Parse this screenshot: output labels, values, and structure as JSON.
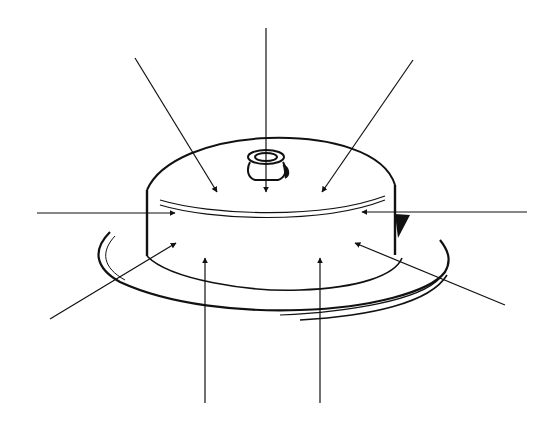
{
  "figure": {
    "background": "#ffffff",
    "ink": "#111111",
    "arrows": [
      {
        "id": "top-center",
        "from": [
          266,
          28
        ],
        "to": [
          266,
          192
        ]
      },
      {
        "id": "top-left",
        "from": [
          135,
          58
        ],
        "to": [
          217,
          192
        ]
      },
      {
        "id": "top-right",
        "from": [
          413,
          60
        ],
        "to": [
          322,
          192
        ]
      },
      {
        "id": "mid-left",
        "from": [
          37,
          213
        ],
        "to": [
          175,
          213
        ]
      },
      {
        "id": "mid-right",
        "from": [
          527,
          212
        ],
        "to": [
          362,
          212
        ]
      },
      {
        "id": "lower-left",
        "from": [
          50,
          319
        ],
        "to": [
          176,
          243
        ]
      },
      {
        "id": "lower-right",
        "from": [
          505,
          305
        ],
        "to": [
          355,
          243
        ]
      },
      {
        "id": "bottom-left",
        "from": [
          205,
          403
        ],
        "to": [
          205,
          258
        ]
      },
      {
        "id": "bottom-right",
        "from": [
          320,
          403
        ],
        "to": [
          320,
          258
        ]
      }
    ]
  }
}
